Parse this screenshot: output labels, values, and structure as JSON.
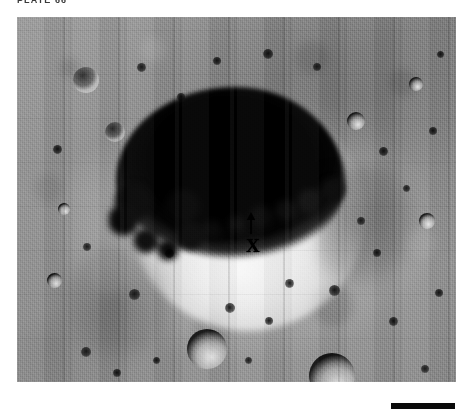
{
  "figure": {
    "plate_label": "PLATE 66",
    "photo_alt": "Lunar Orbiter photograph of a large shadowed crater",
    "markers": {
      "arrow": "arrow-up-marker",
      "x": "X"
    },
    "scale_bar": {
      "name": "scale-bar",
      "color": "#0a0a0a"
    }
  },
  "colors": {
    "page_background": "#ffffff",
    "caption_text": "#3a3a3a",
    "regolith_mid": "#949494",
    "shadow_black": "#000000",
    "highlight_white": "#ffffff"
  },
  "craters": [
    {
      "name": "crater-secondary-1",
      "x": 56,
      "y": 50,
      "d": 26,
      "style": "lit"
    },
    {
      "name": "crater-secondary-2",
      "x": 88,
      "y": 105,
      "d": 20,
      "style": "lit"
    },
    {
      "name": "crater-secondary-3",
      "x": 170,
      "y": 312,
      "d": 40,
      "style": "sh"
    },
    {
      "name": "crater-secondary-4",
      "x": 292,
      "y": 336,
      "d": 46,
      "style": "sh"
    },
    {
      "name": "crater-secondary-5",
      "x": 330,
      "y": 95,
      "d": 18,
      "style": "sh"
    },
    {
      "name": "crater-secondary-6",
      "x": 392,
      "y": 60,
      "d": 14,
      "style": "sh"
    },
    {
      "name": "crater-secondary-7",
      "x": 402,
      "y": 196,
      "d": 16,
      "style": "sh"
    },
    {
      "name": "crater-secondary-8",
      "x": 41,
      "y": 186,
      "d": 12,
      "style": "sh"
    },
    {
      "name": "crater-secondary-9",
      "x": 30,
      "y": 256,
      "d": 15,
      "style": "sh"
    },
    {
      "name": "crater-secondary-10",
      "x": 112,
      "y": 272,
      "d": 11,
      "style": "dot"
    },
    {
      "name": "crater-secondary-11",
      "x": 148,
      "y": 232,
      "d": 9,
      "style": "dot"
    },
    {
      "name": "crater-secondary-12",
      "x": 208,
      "y": 286,
      "d": 10,
      "style": "dot"
    },
    {
      "name": "crater-secondary-13",
      "x": 248,
      "y": 300,
      "d": 8,
      "style": "dot"
    },
    {
      "name": "crater-secondary-14",
      "x": 268,
      "y": 262,
      "d": 9,
      "style": "dot"
    },
    {
      "name": "crater-secondary-15",
      "x": 312,
      "y": 268,
      "d": 11,
      "style": "dot"
    },
    {
      "name": "crater-secondary-16",
      "x": 356,
      "y": 232,
      "d": 8,
      "style": "dot"
    },
    {
      "name": "crater-secondary-17",
      "x": 372,
      "y": 300,
      "d": 9,
      "style": "dot"
    },
    {
      "name": "crater-secondary-18",
      "x": 418,
      "y": 272,
      "d": 8,
      "style": "dot"
    },
    {
      "name": "crater-secondary-19",
      "x": 120,
      "y": 46,
      "d": 9,
      "style": "dot"
    },
    {
      "name": "crater-secondary-20",
      "x": 196,
      "y": 40,
      "d": 8,
      "style": "dot"
    },
    {
      "name": "crater-secondary-21",
      "x": 246,
      "y": 32,
      "d": 10,
      "style": "dot"
    },
    {
      "name": "crater-secondary-22",
      "x": 296,
      "y": 46,
      "d": 8,
      "style": "dot"
    },
    {
      "name": "crater-secondary-23",
      "x": 362,
      "y": 130,
      "d": 9,
      "style": "dot"
    },
    {
      "name": "crater-secondary-24",
      "x": 412,
      "y": 110,
      "d": 8,
      "style": "dot"
    },
    {
      "name": "crater-secondary-25",
      "x": 64,
      "y": 330,
      "d": 10,
      "style": "dot"
    },
    {
      "name": "crater-secondary-26",
      "x": 96,
      "y": 352,
      "d": 8,
      "style": "dot"
    },
    {
      "name": "crater-secondary-27",
      "x": 136,
      "y": 340,
      "d": 7,
      "style": "dot"
    },
    {
      "name": "crater-secondary-28",
      "x": 228,
      "y": 340,
      "d": 7,
      "style": "dot"
    },
    {
      "name": "crater-secondary-29",
      "x": 404,
      "y": 348,
      "d": 8,
      "style": "dot"
    },
    {
      "name": "crater-secondary-30",
      "x": 36,
      "y": 128,
      "d": 9,
      "style": "dot"
    },
    {
      "name": "crater-secondary-31",
      "x": 66,
      "y": 226,
      "d": 8,
      "style": "dot"
    },
    {
      "name": "crater-secondary-32",
      "x": 420,
      "y": 34,
      "d": 7,
      "style": "dot"
    },
    {
      "name": "crater-secondary-33",
      "x": 160,
      "y": 76,
      "d": 8,
      "style": "dot"
    },
    {
      "name": "crater-secondary-34",
      "x": 386,
      "y": 168,
      "d": 7,
      "style": "dot"
    },
    {
      "name": "crater-secondary-35",
      "x": 340,
      "y": 200,
      "d": 8,
      "style": "dot"
    }
  ]
}
